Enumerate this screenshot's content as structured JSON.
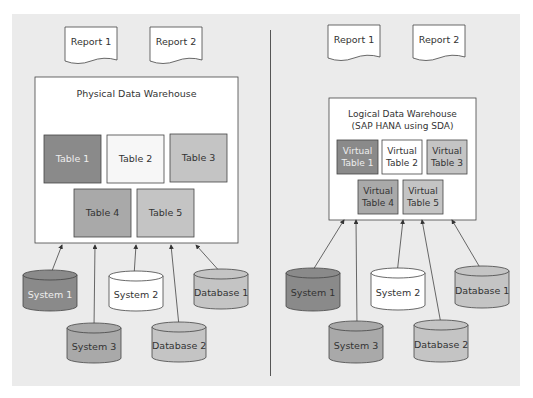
{
  "left": {
    "reports": [
      "Report 1",
      "Report 2"
    ],
    "warehouse_title": "Physical Data Warehouse",
    "tables": [
      "Table 1",
      "Table 2",
      "Table 3",
      "Table 4",
      "Table 5"
    ],
    "sources": [
      "System 1",
      "System 2",
      "Database 1",
      "System 3",
      "Database 2"
    ]
  },
  "right": {
    "reports": [
      "Report 1",
      "Report 2"
    ],
    "warehouse_title_line1": "Logical Data Warehouse",
    "warehouse_title_line2": "(SAP HANA using SDA)",
    "tables": [
      "Virtual Table 1",
      "Virtual Table 2",
      "Virtual Table 3",
      "Virtual Table 4",
      "Virtual Table 5"
    ],
    "sources": [
      "System 1",
      "System 2",
      "Database 1",
      "System 3",
      "Database 2"
    ]
  },
  "colors": {
    "dark": "#8a8a8a",
    "mid": "#a9a9a9",
    "light": "#c4c4c4",
    "white": "#ffffff",
    "bg": "#ebebeb"
  }
}
